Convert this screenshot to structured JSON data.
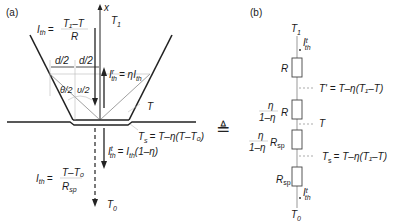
{
  "panel_a": {
    "label": "(a)",
    "axis_label": "x",
    "T1": "T",
    "T1_sub": "1",
    "T": "T",
    "T0": "T",
    "T0_sub": "0",
    "Ith_top": {
      "lhs": "I",
      "lhs_sub": "th",
      "eq": "=",
      "num": "T₁–T",
      "den": "R"
    },
    "Ith_bottom": {
      "lhs": "I",
      "lhs_sub": "th",
      "eq": "=",
      "num": "T–T₀",
      "den": "R",
      "den_sub": "sp"
    },
    "reflected": {
      "lhs": "I",
      "lhs_sup": "r",
      "lhs_sub": "th",
      "rhs": "= ηI",
      "rhs_sub": "th"
    },
    "transmitted": {
      "lhs": "I",
      "lhs_sup": "t",
      "lhs_sub": "th",
      "rhs": "= I",
      "rhs_sub": "th",
      "rhs_tail": "(1–η)"
    },
    "Ts": {
      "lhs": "T",
      "lhs_sub": "s",
      "rhs": "= T–η(T–T₀)"
    },
    "d_half_left": "d/2",
    "d_half_right": "d/2",
    "theta_half": "θ/2",
    "upsilon_half": "υ/2"
  },
  "equiv_symbol": "≜",
  "panel_b": {
    "label": "(b)",
    "top": {
      "T": "T",
      "sub": "1"
    },
    "bottom": {
      "T": "T",
      "sub": "0"
    },
    "flux_top": {
      "I": "I",
      "sup": "t",
      "sub": "th"
    },
    "flux_bottom": {
      "I": "I",
      "sup": "t",
      "sub": "th"
    },
    "resistors": [
      {
        "name": "R",
        "sub": "",
        "frac": false
      },
      {
        "name": "R",
        "sub": "",
        "frac": true,
        "num": "η",
        "den": "1–η"
      },
      {
        "name": "R",
        "sub": "sp",
        "frac": true,
        "num": "η",
        "den": "1–η"
      },
      {
        "name": "R",
        "sub": "sp",
        "frac": false
      }
    ],
    "nodes": [
      {
        "text": "T' = T–η(T₁–T)"
      },
      {
        "text": "T"
      },
      {
        "text": "T",
        "sub": "s",
        "rhs": "= T–η(T₁–T)"
      }
    ]
  }
}
